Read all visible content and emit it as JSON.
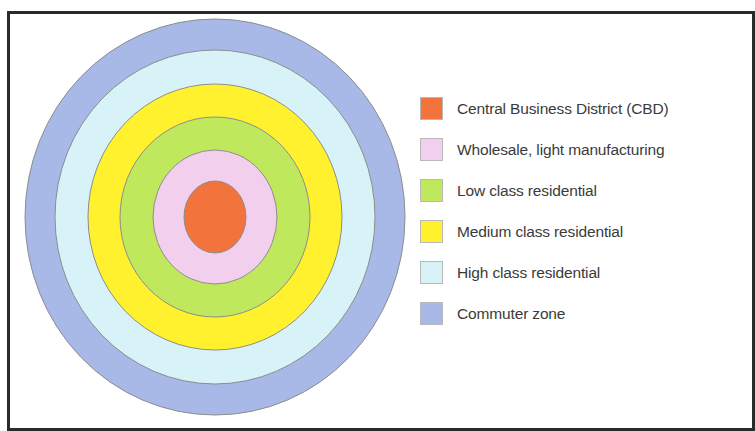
{
  "figure": {
    "frame_color": "#2a2a2a",
    "background": "#ffffff"
  },
  "chart_data": {
    "type": "pie",
    "subtitle": "",
    "xlabel": "",
    "ylabel": "",
    "legend_position": "right",
    "grid": false,
    "categories": [
      "Central Business District (CBD)",
      "Wholesale, light manufacturing",
      "Low class residential",
      "Medium class residential",
      "High class residential",
      "Commuter zone"
    ],
    "values": [
      1,
      2,
      3,
      4,
      5,
      6
    ],
    "colors": [
      "#f2743c",
      "#f2cfec",
      "#bfe85c",
      "#fff12e",
      "#d7f3f7",
      "#a8b9e8"
    ],
    "annotations": [
      "Zones drawn as nested concentric ellipses, innermost = CBD, outermost = commuter zone"
    ]
  },
  "zones": [
    {
      "index": 0,
      "name": "commuter-zone",
      "label": "Commuter zone",
      "color": "#a8b9e8",
      "rx": 190,
      "ry": 198
    },
    {
      "index": 1,
      "name": "high-class-residential",
      "label": "High class residential",
      "color": "#d7f3f7",
      "rx": 160,
      "ry": 167
    },
    {
      "index": 2,
      "name": "medium-class-residential",
      "label": "Medium class residential",
      "color": "#fff12e",
      "rx": 127,
      "ry": 133
    },
    {
      "index": 3,
      "name": "low-class-residential",
      "label": "Low class residential",
      "color": "#bfe85c",
      "rx": 95,
      "ry": 100
    },
    {
      "index": 4,
      "name": "wholesale-light-manufacturing",
      "label": "Wholesale, light manufacturing",
      "color": "#f2cfec",
      "rx": 62,
      "ry": 67
    },
    {
      "index": 5,
      "name": "central-business-district",
      "label": "Central Business District (CBD)",
      "color": "#f2743c",
      "rx": 31,
      "ry": 36
    }
  ],
  "legend": {
    "items": [
      {
        "label": "Central Business District (CBD)",
        "color": "#f2743c",
        "zone": "central-business-district"
      },
      {
        "label": "Wholesale, light manufacturing",
        "color": "#f2cfec",
        "zone": "wholesale-light-manufacturing"
      },
      {
        "label": "Low class residential",
        "color": "#bfe85c",
        "zone": "low-class-residential"
      },
      {
        "label": "Medium class residential",
        "color": "#fff12e",
        "zone": "medium-class-residential"
      },
      {
        "label": "High class residential",
        "color": "#d7f3f7",
        "zone": "high-class-residential"
      },
      {
        "label": "Commuter zone",
        "color": "#a8b9e8",
        "zone": "commuter-zone"
      }
    ]
  },
  "geometry": {
    "center_x": 215,
    "center_y": 217,
    "stroke_color": "#8d8d8d",
    "stroke_width": 1
  }
}
